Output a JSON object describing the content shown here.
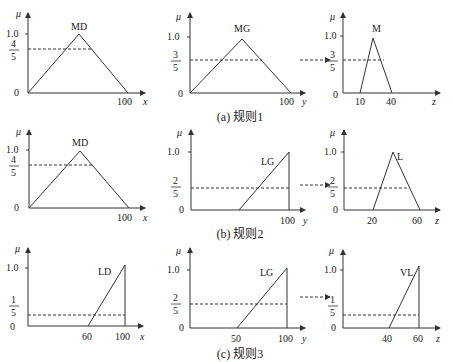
{
  "figure": {
    "rows": [
      {
        "caption": "(a) 规则1",
        "panels": [
          {
            "axis": "x",
            "mu_label": "μ",
            "y_ticks": [
              "1.0",
              "0"
            ],
            "cut_num": "4",
            "cut_den": "5",
            "cut_value": 0.8,
            "set_label": "MD",
            "shape": "triangle",
            "points": [
              [
                0,
                0
              ],
              [
                50,
                1
              ],
              [
                100,
                0
              ]
            ],
            "x_ticks": [
              "100"
            ]
          },
          {
            "axis": "y",
            "mu_label": "μ",
            "y_ticks": [
              "1.0",
              "0"
            ],
            "cut_num": "3",
            "cut_den": "5",
            "cut_value": 0.6,
            "set_label": "MG",
            "shape": "triangle",
            "points": [
              [
                0,
                0
              ],
              [
                50,
                1
              ],
              [
                100,
                0
              ]
            ],
            "x_ticks": [
              "100"
            ]
          },
          {
            "axis": "z",
            "mu_label": "μ",
            "y_ticks": [
              "1.0",
              "0"
            ],
            "cut_num": "3",
            "cut_den": "5",
            "cut_value": 0.6,
            "set_label": "M",
            "shape": "triangle",
            "points": [
              [
                10,
                0
              ],
              [
                25,
                1
              ],
              [
                40,
                0
              ]
            ],
            "x_ticks": [
              "10",
              "40"
            ]
          }
        ]
      },
      {
        "caption": "(b) 规则2",
        "panels": [
          {
            "axis": "x",
            "mu_label": "μ",
            "y_ticks": [
              "1.0",
              "0"
            ],
            "cut_num": "4",
            "cut_den": "5",
            "cut_value": 0.8,
            "set_label": "MD",
            "shape": "triangle",
            "points": [
              [
                0,
                0
              ],
              [
                50,
                1
              ],
              [
                100,
                0
              ]
            ],
            "x_ticks": [
              "100"
            ]
          },
          {
            "axis": "y",
            "mu_label": "μ",
            "y_ticks": [
              "1.0",
              "0"
            ],
            "cut_num": "2",
            "cut_den": "5",
            "cut_value": 0.4,
            "set_label": "LG",
            "shape": "ramp",
            "points": [
              [
                50,
                0
              ],
              [
                100,
                1
              ],
              [
                100,
                0
              ]
            ],
            "x_ticks": [
              "100"
            ]
          },
          {
            "axis": "z",
            "mu_label": "μ",
            "y_ticks": [
              "1.0",
              "0"
            ],
            "cut_num": "2",
            "cut_den": "5",
            "cut_value": 0.4,
            "set_label": "L",
            "shape": "triangle",
            "points": [
              [
                20,
                0
              ],
              [
                40,
                1
              ],
              [
                60,
                0
              ]
            ],
            "x_ticks": [
              "20",
              "60"
            ]
          }
        ]
      },
      {
        "caption": "(c) 规则3",
        "panels": [
          {
            "axis": "x",
            "mu_label": "μ",
            "y_ticks": [
              "1.0",
              "0"
            ],
            "cut_num": "1",
            "cut_den": "5",
            "cut_value": 0.2,
            "set_label": "LD",
            "shape": "ramp",
            "points": [
              [
                60,
                0
              ],
              [
                100,
                1
              ],
              [
                100,
                0
              ]
            ],
            "x_ticks": [
              "60",
              "100"
            ]
          },
          {
            "axis": "y",
            "mu_label": "μ",
            "y_ticks": [
              "1.0",
              "0"
            ],
            "cut_num": "2",
            "cut_den": "5",
            "cut_value": 0.4,
            "set_label": "LG",
            "shape": "ramp",
            "points": [
              [
                50,
                0
              ],
              [
                100,
                1
              ],
              [
                100,
                0
              ]
            ],
            "x_ticks": [
              "50",
              "100"
            ]
          },
          {
            "axis": "z",
            "mu_label": "μ",
            "y_ticks": [
              "1.0",
              "0"
            ],
            "cut_num": "1",
            "cut_den": "5",
            "cut_value": 0.2,
            "set_label": "VL",
            "shape": "ramp",
            "points": [
              [
                40,
                0
              ],
              [
                60,
                1
              ],
              [
                60,
                0
              ]
            ],
            "x_ticks": [
              "40",
              "60"
            ]
          }
        ]
      }
    ]
  }
}
